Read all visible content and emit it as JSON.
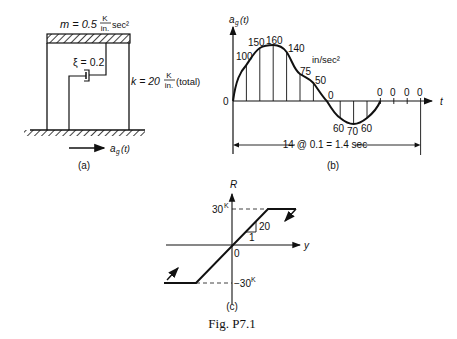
{
  "figure_a": {
    "mass_label": "m = 0.5",
    "mass_unit_num": "K",
    "mass_unit_den": "in.",
    "mass_unit_tail": "sec²",
    "damping_label": "ξ = 0.2",
    "stiffness_label": "k = 20",
    "stiffness_unit_num": "K",
    "stiffness_unit_den": "in.",
    "stiffness_tail": "(total)",
    "ground_accel_label": "a",
    "ground_accel_sub": "g",
    "ground_accel_arg": "(t)",
    "caption": "(a)"
  },
  "figure_b": {
    "y_axis_label": "a",
    "y_axis_sub": "g",
    "y_axis_arg": "(t)",
    "x_axis_label": "t",
    "origin_label": "0",
    "units": "in/sec²",
    "values": [
      "100",
      "150",
      "160",
      "140",
      "75",
      "50",
      "0",
      "60",
      "70",
      "60",
      "0",
      "0",
      "0",
      "0"
    ],
    "span_label": "14 @ 0.1 = 1.4 sec",
    "caption": "(b)"
  },
  "figure_c": {
    "y_axis_label": "R",
    "x_axis_label": "y",
    "origin_label": "0",
    "upper_label": "30",
    "upper_sup": "K",
    "lower_label": "−30",
    "lower_sup": "K",
    "slope_rise": "20",
    "slope_run": "1",
    "caption": "(c)"
  },
  "figure_caption": "Fig. P7.1"
}
